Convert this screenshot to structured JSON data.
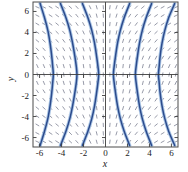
{
  "figure": {
    "kind": "slope-field-plot",
    "background_color": "#ffffff",
    "frame_color": "#4a4a4a",
    "axis_color": "#3c3c3c",
    "slope_dash_color": "#8b8f9e",
    "solution_curve_color": "#2c4b8c",
    "solution_curve_halo_color": "#a9c4e4"
  },
  "axes": {
    "x_label": "x",
    "y_label": "y",
    "x_ticks": [
      "-6",
      "-4",
      "-2",
      "0",
      "2",
      "4",
      "6"
    ],
    "y_ticks": [
      "6",
      "4",
      "2",
      "0",
      "-2",
      "-4",
      "-6"
    ]
  },
  "chart_data": {
    "type": "line",
    "title": "",
    "xlabel": "x",
    "ylabel": "y",
    "xlim": [
      -6.6,
      6.6
    ],
    "ylim": [
      -6.9,
      6.9
    ],
    "xticks": [
      -6,
      -4,
      -2,
      0,
      2,
      4,
      6
    ],
    "yticks": [
      -6,
      -4,
      -2,
      0,
      2,
      4,
      6
    ],
    "grid": false,
    "legend": null,
    "field": {
      "name": "slope field",
      "style": "dashed short segments",
      "x_samples": [
        -6.2,
        -5.6,
        -5.0,
        -4.4,
        -3.8,
        -3.2,
        -2.6,
        -2.0,
        -1.4,
        -0.8,
        -0.2,
        0.4,
        1.0,
        1.6,
        2.2,
        2.8,
        3.4,
        4.0,
        4.6,
        5.2,
        5.8,
        6.4
      ],
      "y_samples": [
        -6.4,
        -5.6,
        -4.8,
        -4.0,
        -3.2,
        -2.4,
        -1.6,
        -0.8,
        0.0,
        0.8,
        1.6,
        2.4,
        3.2,
        4.0,
        4.8,
        5.6,
        6.4
      ],
      "description": "segments tilt from lower-left to upper-right on the left half and from upper-left to lower-right on the right half, nearly vertical near the y axis"
    },
    "series": [
      {
        "name": "solution curve 1",
        "x_at_y0": -4.75,
        "values": [
          [
            -5.95,
            6.75
          ],
          [
            -5.55,
            5.4
          ],
          [
            -5.25,
            4.2
          ],
          [
            -5.05,
            3.0
          ],
          [
            -4.9,
            1.8
          ],
          [
            -4.8,
            0.7
          ],
          [
            -4.75,
            0.0
          ],
          [
            -4.8,
            -0.7
          ],
          [
            -4.9,
            -1.8
          ],
          [
            -5.05,
            -3.0
          ],
          [
            -5.25,
            -4.2
          ],
          [
            -5.55,
            -5.4
          ],
          [
            -5.95,
            -6.75
          ]
        ]
      },
      {
        "name": "solution curve 2",
        "x_at_y0": -2.6,
        "values": [
          [
            -4.1,
            6.75
          ],
          [
            -3.6,
            5.4
          ],
          [
            -3.25,
            4.2
          ],
          [
            -3.0,
            3.0
          ],
          [
            -2.8,
            1.8
          ],
          [
            -2.65,
            0.7
          ],
          [
            -2.6,
            0.0
          ],
          [
            -2.65,
            -0.7
          ],
          [
            -2.8,
            -1.8
          ],
          [
            -3.0,
            -3.0
          ],
          [
            -3.25,
            -4.2
          ],
          [
            -3.6,
            -5.4
          ],
          [
            -4.1,
            -6.75
          ]
        ]
      },
      {
        "name": "solution curve 3",
        "x_at_y0": -0.62,
        "values": [
          [
            -2.1,
            6.75
          ],
          [
            -1.6,
            5.4
          ],
          [
            -1.25,
            4.2
          ],
          [
            -1.0,
            3.0
          ],
          [
            -0.82,
            1.8
          ],
          [
            -0.68,
            0.7
          ],
          [
            -0.62,
            0.0
          ],
          [
            -0.68,
            -0.7
          ],
          [
            -0.82,
            -1.8
          ],
          [
            -1.0,
            -3.0
          ],
          [
            -1.25,
            -4.2
          ],
          [
            -1.6,
            -5.4
          ],
          [
            -2.1,
            -6.75
          ]
        ]
      },
      {
        "name": "solution curve 4",
        "x_at_y0": 0.72,
        "values": [
          [
            2.2,
            6.75
          ],
          [
            1.7,
            5.4
          ],
          [
            1.35,
            4.2
          ],
          [
            1.1,
            3.0
          ],
          [
            0.92,
            1.8
          ],
          [
            0.78,
            0.7
          ],
          [
            0.72,
            0.0
          ],
          [
            0.78,
            -0.7
          ],
          [
            0.92,
            -1.8
          ],
          [
            1.1,
            -3.0
          ],
          [
            1.35,
            -4.2
          ],
          [
            1.7,
            -5.4
          ],
          [
            2.2,
            -6.75
          ]
        ]
      },
      {
        "name": "solution curve 5",
        "x_at_y0": 2.72,
        "values": [
          [
            4.2,
            6.75
          ],
          [
            3.7,
            5.4
          ],
          [
            3.35,
            4.2
          ],
          [
            3.1,
            3.0
          ],
          [
            2.92,
            1.8
          ],
          [
            2.78,
            0.7
          ],
          [
            2.72,
            0.0
          ],
          [
            2.78,
            -0.7
          ],
          [
            2.92,
            -1.8
          ],
          [
            3.1,
            -3.0
          ],
          [
            3.35,
            -4.2
          ],
          [
            3.7,
            -5.4
          ],
          [
            4.2,
            -6.75
          ]
        ]
      },
      {
        "name": "solution curve 6",
        "x_at_y0": 4.82,
        "values": [
          [
            6.3,
            6.75
          ],
          [
            5.75,
            5.4
          ],
          [
            5.4,
            4.2
          ],
          [
            5.15,
            3.0
          ],
          [
            4.98,
            1.8
          ],
          [
            4.88,
            0.7
          ],
          [
            4.82,
            0.0
          ],
          [
            4.88,
            -0.7
          ],
          [
            4.98,
            -1.8
          ],
          [
            5.15,
            -3.0
          ],
          [
            5.4,
            -4.2
          ],
          [
            5.75,
            -5.4
          ],
          [
            6.3,
            -6.75
          ]
        ]
      }
    ]
  }
}
